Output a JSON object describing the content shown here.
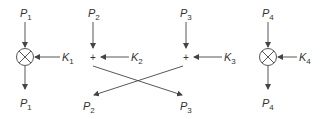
{
  "diagram": {
    "blocks": [
      {
        "id": "block-1",
        "type": "multiply",
        "input": {
          "base": "P",
          "sub": "1"
        },
        "key": {
          "base": "K",
          "sub": "1"
        },
        "output": {
          "base": "P",
          "sub": "1"
        }
      },
      {
        "id": "block-2",
        "type": "add",
        "input": {
          "base": "P",
          "sub": "2"
        },
        "key": {
          "base": "K",
          "sub": "2"
        },
        "output": {
          "base": "P",
          "sub": "2"
        }
      },
      {
        "id": "block-3",
        "type": "add",
        "input": {
          "base": "P",
          "sub": "3"
        },
        "key": {
          "base": "K",
          "sub": "3"
        },
        "output": {
          "base": "P",
          "sub": "3"
        }
      },
      {
        "id": "block-4",
        "type": "multiply",
        "input": {
          "base": "P",
          "sub": "4"
        },
        "key": {
          "base": "K",
          "sub": "4"
        },
        "output": {
          "base": "P",
          "sub": "4"
        }
      }
    ],
    "plus_symbol": "+",
    "crossing": "outputs of blocks 2 and 3 are swapped"
  }
}
